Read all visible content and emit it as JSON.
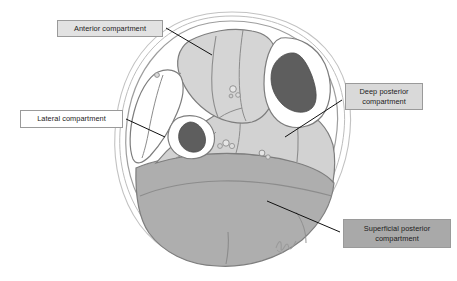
{
  "figure": {
    "background_color": "#ffffff",
    "width": 457,
    "height": 281
  },
  "labels": {
    "anterior": {
      "text": "Anterior compartment",
      "fill": "#e2e2e2",
      "border": "#9a9a9a"
    },
    "lateral": {
      "text": "Lateral compartment",
      "fill": "#ffffff",
      "border": "#9a9a9a"
    },
    "deep_posterior": {
      "text": "Deep posterior\ncompartment",
      "fill": "#d9d9d9",
      "border": "#9a9a9a"
    },
    "superficial_posterior": {
      "text": "Superficial posterior\ncompartment",
      "fill": "#a9a9a9",
      "border": "#8a8a8a"
    }
  },
  "anatomy": {
    "skin_outline_color": "#b9b9b9",
    "fascia_outline_color": "#8d8d8d",
    "muscle_outline_color": "#7d7d7d",
    "anterior_compartment_fill": "#d5d5d5",
    "lateral_compartment_fill": "#ffffff",
    "deep_posterior_fill": "#d2d2d2",
    "superficial_posterior_fill": "#aeaeae",
    "bone_fill": "#5e5e5e",
    "bone_outline": "#4a4a4a",
    "vessel_outline": "#8a8a8a",
    "leader_line_color": "#111111",
    "signature_color": "#9a9a9a",
    "structures": [
      "tibia",
      "fibula",
      "tibialis anterior",
      "extensor digitorum longus",
      "peroneus longus",
      "peroneus brevis",
      "tibialis posterior",
      "flexor digitorum longus",
      "flexor hallucis longus",
      "soleus",
      "gastrocnemius medial head",
      "gastrocnemius lateral head",
      "interosseous membrane",
      "anterior tibial vessels",
      "posterior tibial vessels",
      "peroneal vessels"
    ]
  }
}
